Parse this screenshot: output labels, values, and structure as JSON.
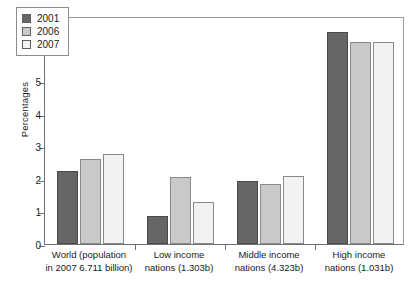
{
  "chart_data": {
    "type": "bar",
    "title": "",
    "xlabel": "",
    "ylabel": "Percentages",
    "ylim": [
      0,
      7
    ],
    "yticks": [
      0,
      1,
      2,
      3,
      4,
      5,
      6,
      7
    ],
    "grid": false,
    "legend_position": "top-left",
    "categories": [
      "World (population in 2007 6.711 billion)",
      "Low income nations (1.303b)",
      "Middle income nations (4.323b)",
      "High income nations (1.031b)"
    ],
    "category_lines": [
      [
        "World (population",
        "in 2007 6.711 billion)"
      ],
      [
        "Low income",
        "nations (1.303b)"
      ],
      [
        "Middle income",
        "nations (4.323b)"
      ],
      [
        "High income",
        "nations (1.031b)"
      ]
    ],
    "series": [
      {
        "name": "2001",
        "color": "#666666",
        "values": [
          2.25,
          0.85,
          1.95,
          6.5
        ]
      },
      {
        "name": "2006",
        "color": "#c9c9c9",
        "values": [
          2.6,
          2.05,
          1.85,
          6.2
        ]
      },
      {
        "name": "2007",
        "color": "#f2f2f2",
        "values": [
          2.75,
          1.3,
          2.1,
          6.2
        ]
      }
    ]
  },
  "axis": {
    "y_title": "Percentages",
    "y_tick_labels": [
      "0",
      "1",
      "2",
      "3",
      "4",
      "5",
      "6",
      "7"
    ]
  },
  "legend": {
    "entries": [
      {
        "label": "2001"
      },
      {
        "label": "2006"
      },
      {
        "label": "2007"
      }
    ]
  }
}
